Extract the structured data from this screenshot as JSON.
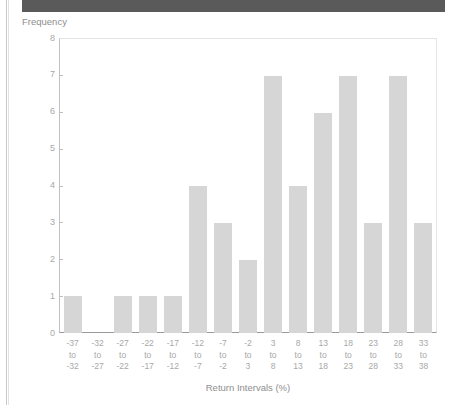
{
  "header": {
    "banner_text": "",
    "banner_color": "#5a5a5a"
  },
  "chart_data": {
    "type": "bar",
    "title": "",
    "xlabel": "Return Intervals (%)",
    "ylabel": "Frequency",
    "categories": [
      "-37\nto\n-32",
      "-32\nto\n-27",
      "-27\nto\n-22",
      "-22\nto\n-17",
      "-17\nto\n-12",
      "-12\nto\n-7",
      "-7\nto\n-2",
      "-2\nto\n3",
      "3\nto\n8",
      "8\nto\n13",
      "13\nto\n18",
      "18\nto\n23",
      "23\nto\n28",
      "28\nto\n33",
      "33\nto\n38"
    ],
    "values": [
      1,
      0,
      1,
      1,
      1,
      4,
      3,
      2,
      7,
      4,
      6,
      7,
      3,
      7,
      3
    ],
    "ylim": [
      0,
      8
    ],
    "yticks": [
      0,
      1,
      2,
      3,
      4,
      5,
      6,
      7,
      8
    ],
    "ytick_labels": [
      "0",
      "1",
      "2",
      "3",
      "4",
      "5",
      "6",
      "7",
      "8"
    ],
    "grid": false,
    "legend": null,
    "bar_color": "#d6d6d6"
  }
}
